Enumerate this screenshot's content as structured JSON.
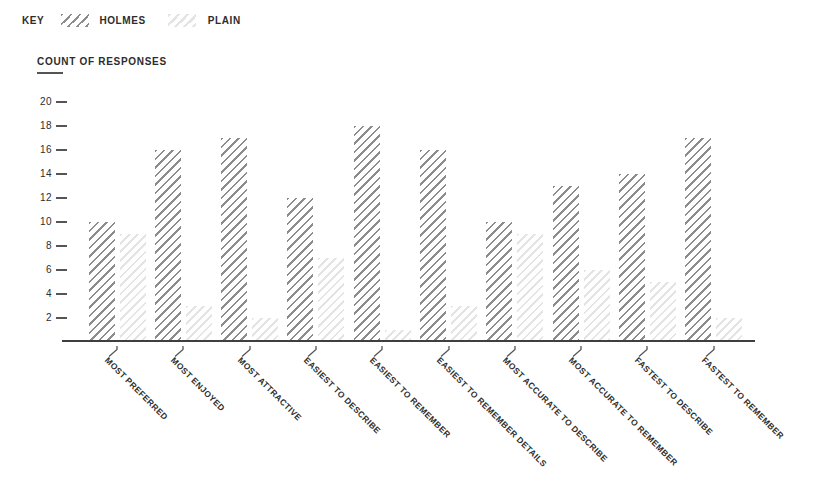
{
  "key": {
    "label": "KEY",
    "items": [
      {
        "label": "HOLMES",
        "swatch": "dark-diagonal-hatch"
      },
      {
        "label": "PLAIN",
        "swatch": "light-diagonal-hatch"
      }
    ]
  },
  "chart_data": {
    "type": "bar",
    "title": "COUNT OF RESPONSES",
    "ylabel": "COUNT OF RESPONSES",
    "xlabel": "",
    "categories": [
      "MOST PREFERRED",
      "MOST ENJOYED",
      "MOST ATTRACTIVE",
      "EASIEST TO DESCRIBE",
      "EASIEST TO REMEMBER",
      "EASIEST TO REMEMBER DETAILS",
      "MOST ACCURATE TO DESCRIBE",
      "MOST ACCURATE TO REMEMBER",
      "FASTEST TO DESCRIBE",
      "FASTEST TO REMEMBER"
    ],
    "series": [
      {
        "name": "HOLMES",
        "hatch": "dark-diagonal",
        "values": [
          10,
          16,
          17,
          12,
          18,
          16,
          10,
          13,
          14,
          17
        ]
      },
      {
        "name": "PLAIN",
        "hatch": "light-diagonal",
        "values": [
          9,
          3,
          2,
          7,
          1,
          3,
          9,
          6,
          5,
          2
        ]
      }
    ],
    "ylim": [
      0,
      20
    ],
    "yticks": [
      2,
      4,
      6,
      8,
      10,
      12,
      14,
      16,
      18,
      20
    ],
    "grid": false,
    "legend_position": "top-left",
    "x_tick_label_rotation_deg": 45,
    "colors": {
      "holmes_hatch": "#8c8c8c",
      "plain_hatch": "#e4e4e4",
      "axis": "#3f3f3f",
      "tick": "#555555",
      "text": "#2d2d2d"
    }
  }
}
